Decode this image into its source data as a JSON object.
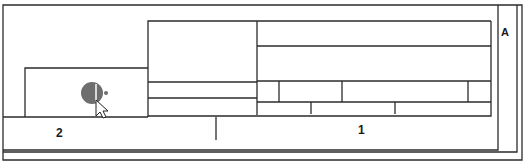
{
  "diagram": {
    "labels": {
      "region_1": "1",
      "region_2": "2",
      "region_a": "A"
    },
    "colors": {
      "line": "#2b2b2b",
      "cursor_busy": "#6e6e6e",
      "background": "#ffffff"
    },
    "icons": {
      "cursor": "busy-arrow-cursor"
    }
  }
}
